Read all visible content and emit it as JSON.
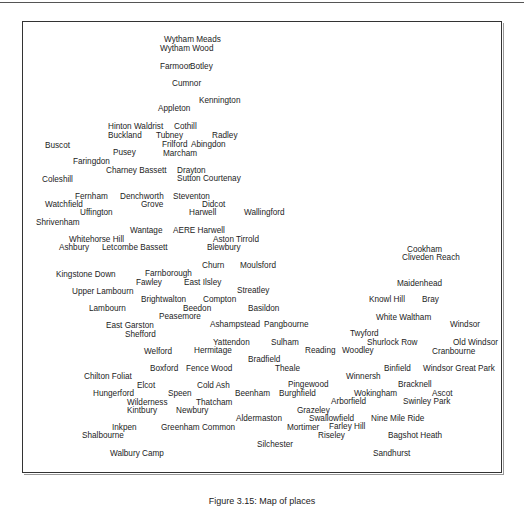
{
  "figure": {
    "caption": "Figure 3.15: Map of places"
  },
  "places": [
    {
      "name": "Wytham Meads",
      "x": 164,
      "y": 42
    },
    {
      "name": "Wytham Wood",
      "x": 160,
      "y": 51
    },
    {
      "name": "Farmoor",
      "x": 160,
      "y": 69
    },
    {
      "name": "Botley",
      "x": 190,
      "y": 69
    },
    {
      "name": "Cumnor",
      "x": 172,
      "y": 86
    },
    {
      "name": "Kennington",
      "x": 199,
      "y": 103
    },
    {
      "name": "Appleton",
      "x": 158,
      "y": 111
    },
    {
      "name": "Hinton Waldrist",
      "x": 108,
      "y": 129
    },
    {
      "name": "Cothill",
      "x": 174,
      "y": 129
    },
    {
      "name": "Buckland",
      "x": 108,
      "y": 138
    },
    {
      "name": "Tubney",
      "x": 156,
      "y": 138
    },
    {
      "name": "Radley",
      "x": 212,
      "y": 138
    },
    {
      "name": "Buscot",
      "x": 45,
      "y": 148
    },
    {
      "name": "Frilford",
      "x": 162,
      "y": 147
    },
    {
      "name": "Abingdon",
      "x": 191,
      "y": 147
    },
    {
      "name": "Pusey",
      "x": 113,
      "y": 155
    },
    {
      "name": "Marcham",
      "x": 163,
      "y": 156
    },
    {
      "name": "Faringdon",
      "x": 73,
      "y": 164
    },
    {
      "name": "Charney Bassett",
      "x": 106,
      "y": 173
    },
    {
      "name": "Drayton",
      "x": 177,
      "y": 173
    },
    {
      "name": "Coleshill",
      "x": 42,
      "y": 182
    },
    {
      "name": "Sutton Courtenay",
      "x": 177,
      "y": 181
    },
    {
      "name": "Fernham",
      "x": 75,
      "y": 199
    },
    {
      "name": "Denchworth",
      "x": 120,
      "y": 199
    },
    {
      "name": "Steventon",
      "x": 173,
      "y": 199
    },
    {
      "name": "Watchfield",
      "x": 45,
      "y": 207
    },
    {
      "name": "Grove",
      "x": 141,
      "y": 207
    },
    {
      "name": "Didcot",
      "x": 202,
      "y": 207
    },
    {
      "name": "Uffington",
      "x": 80,
      "y": 215
    },
    {
      "name": "Harwell",
      "x": 189,
      "y": 215
    },
    {
      "name": "Wallingford",
      "x": 244,
      "y": 215
    },
    {
      "name": "Shrivenham",
      "x": 36,
      "y": 225
    },
    {
      "name": "Wantage",
      "x": 130,
      "y": 233
    },
    {
      "name": "AERE Harwell",
      "x": 173,
      "y": 233
    },
    {
      "name": "Whitehorse Hill",
      "x": 69,
      "y": 242
    },
    {
      "name": "Aston Tirrold",
      "x": 213,
      "y": 242
    },
    {
      "name": "Ashbury",
      "x": 59,
      "y": 250
    },
    {
      "name": "Letcombe Bassett",
      "x": 102,
      "y": 250
    },
    {
      "name": "Blewbury",
      "x": 207,
      "y": 250
    },
    {
      "name": "Cookham",
      "x": 407,
      "y": 252
    },
    {
      "name": "Cliveden Reach",
      "x": 402,
      "y": 260
    },
    {
      "name": "Churn",
      "x": 202,
      "y": 268
    },
    {
      "name": "Moulsford",
      "x": 240,
      "y": 268
    },
    {
      "name": "Kingstone Down",
      "x": 56,
      "y": 277
    },
    {
      "name": "Farnborough",
      "x": 145,
      "y": 276
    },
    {
      "name": "Fawley",
      "x": 136,
      "y": 285
    },
    {
      "name": "East Ilsley",
      "x": 184,
      "y": 285
    },
    {
      "name": "Maidenhead",
      "x": 397,
      "y": 286
    },
    {
      "name": "Upper Lambourn",
      "x": 72,
      "y": 294
    },
    {
      "name": "Streatley",
      "x": 237,
      "y": 293
    },
    {
      "name": "Knowl Hill",
      "x": 369,
      "y": 302
    },
    {
      "name": "Bray",
      "x": 422,
      "y": 302
    },
    {
      "name": "Brightwalton",
      "x": 141,
      "y": 302
    },
    {
      "name": "Compton",
      "x": 203,
      "y": 302
    },
    {
      "name": "Lambourn",
      "x": 89,
      "y": 311
    },
    {
      "name": "Beedon",
      "x": 183,
      "y": 311
    },
    {
      "name": "Basildon",
      "x": 248,
      "y": 311
    },
    {
      "name": "Peasemore",
      "x": 159,
      "y": 319
    },
    {
      "name": "White Waltham",
      "x": 376,
      "y": 320
    },
    {
      "name": "East Garston",
      "x": 106,
      "y": 328
    },
    {
      "name": "Ashampstead",
      "x": 210,
      "y": 327
    },
    {
      "name": "Pangbourne",
      "x": 264,
      "y": 327
    },
    {
      "name": "Windsor",
      "x": 450,
      "y": 327
    },
    {
      "name": "Shefford",
      "x": 125,
      "y": 337
    },
    {
      "name": "Twyford",
      "x": 350,
      "y": 336
    },
    {
      "name": "Yattendon",
      "x": 213,
      "y": 345
    },
    {
      "name": "Sulham",
      "x": 271,
      "y": 345
    },
    {
      "name": "Shurlock Row",
      "x": 367,
      "y": 345
    },
    {
      "name": "Old Windsor",
      "x": 453,
      "y": 345
    },
    {
      "name": "Welford",
      "x": 144,
      "y": 354
    },
    {
      "name": "Hermitage",
      "x": 194,
      "y": 353
    },
    {
      "name": "Reading",
      "x": 305,
      "y": 353
    },
    {
      "name": "Woodley",
      "x": 342,
      "y": 353
    },
    {
      "name": "Cranbourne",
      "x": 432,
      "y": 354
    },
    {
      "name": "Bradfield",
      "x": 248,
      "y": 362
    },
    {
      "name": "Boxford",
      "x": 150,
      "y": 371
    },
    {
      "name": "Fence Wood",
      "x": 186,
      "y": 371
    },
    {
      "name": "Theale",
      "x": 275,
      "y": 371
    },
    {
      "name": "Binfield",
      "x": 384,
      "y": 371
    },
    {
      "name": "Windsor Great Park",
      "x": 423,
      "y": 371
    },
    {
      "name": "Chilton Foliat",
      "x": 84,
      "y": 379
    },
    {
      "name": "Winnersh",
      "x": 346,
      "y": 379
    },
    {
      "name": "Elcot",
      "x": 137,
      "y": 388
    },
    {
      "name": "Cold Ash",
      "x": 197,
      "y": 388
    },
    {
      "name": "Pingewood",
      "x": 288,
      "y": 387
    },
    {
      "name": "Bracknell",
      "x": 398,
      "y": 387
    },
    {
      "name": "Hungerford",
      "x": 93,
      "y": 396
    },
    {
      "name": "Speen",
      "x": 168,
      "y": 396
    },
    {
      "name": "Beenham",
      "x": 235,
      "y": 396
    },
    {
      "name": "Burghfield",
      "x": 279,
      "y": 396
    },
    {
      "name": "Wokingham",
      "x": 354,
      "y": 396
    },
    {
      "name": "Ascot",
      "x": 432,
      "y": 396
    },
    {
      "name": "Wilderness",
      "x": 127,
      "y": 405
    },
    {
      "name": "Thatcham",
      "x": 196,
      "y": 405
    },
    {
      "name": "Arborfield",
      "x": 331,
      "y": 404
    },
    {
      "name": "Swinley Park",
      "x": 403,
      "y": 404
    },
    {
      "name": "Kintbury",
      "x": 127,
      "y": 413
    },
    {
      "name": "Newbury",
      "x": 176,
      "y": 413
    },
    {
      "name": "Grazeley",
      "x": 297,
      "y": 413
    },
    {
      "name": "Aldermaston",
      "x": 236,
      "y": 421
    },
    {
      "name": "Swallowfield",
      "x": 309,
      "y": 421
    },
    {
      "name": "Nine Mile Ride",
      "x": 371,
      "y": 421
    },
    {
      "name": "Inkpen",
      "x": 112,
      "y": 430
    },
    {
      "name": "Greenham Common",
      "x": 161,
      "y": 430
    },
    {
      "name": "Mortimer",
      "x": 287,
      "y": 430
    },
    {
      "name": "Farley Hill",
      "x": 329,
      "y": 429
    },
    {
      "name": "Shalbourne",
      "x": 82,
      "y": 438
    },
    {
      "name": "Riseley",
      "x": 318,
      "y": 438
    },
    {
      "name": "Bagshot Heath",
      "x": 388,
      "y": 438
    },
    {
      "name": "Silchester",
      "x": 257,
      "y": 447
    },
    {
      "name": "Walbury Camp",
      "x": 110,
      "y": 456
    },
    {
      "name": "Sandhurst",
      "x": 373,
      "y": 456
    }
  ]
}
